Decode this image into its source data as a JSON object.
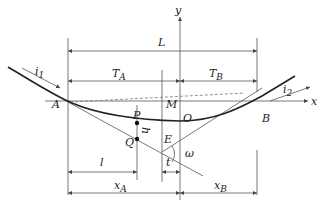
{
  "diagram": {
    "type": "vertical-curve-geometry",
    "axes": {
      "x_label": "x",
      "y_label": "y",
      "origin_label": "O"
    },
    "points": {
      "A": "A",
      "B": "B",
      "O": "O",
      "P": "P",
      "Q": "Q",
      "M": "M",
      "E": "E"
    },
    "dimensions": {
      "total_length": "L",
      "tangent_a": "T",
      "tangent_a_sub": "A",
      "tangent_b": "T",
      "tangent_b_sub": "B",
      "distance_l": "l",
      "distance_t": "t",
      "x_a": "x",
      "x_a_sub": "A",
      "x_b": "x",
      "x_b_sub": "B",
      "height_h": "h",
      "angle": "ω"
    },
    "grades": {
      "grade_1": "i",
      "grade_1_sub": "1",
      "grade_2": "i",
      "grade_2_sub": "2"
    }
  }
}
